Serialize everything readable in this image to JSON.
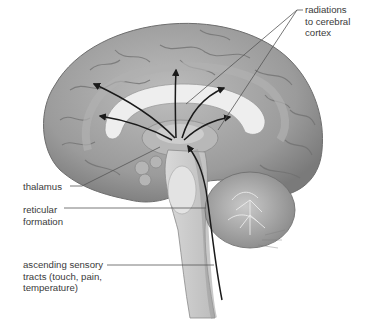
{
  "figure": {
    "background": "#ffffff",
    "colors": {
      "brain_base": "#9a9a9a",
      "brain_light": "#c4c4c4",
      "brain_dark": "#6e6e6e",
      "white_matter": "#eeeeee",
      "arrow": "#1a1a1a",
      "leader_line": "#555555",
      "label_text": "#3a3a3a"
    }
  },
  "labels": {
    "radiations": "radiations\nto cerebral\ncortex",
    "thalamus": "thalamus",
    "reticular": "reticular\nformation",
    "ascending": "ascending sensory\ntracts (touch, pain,\ntemperature)"
  },
  "structures": {
    "cerebrum": "cerebral cortex",
    "corpus_callosum": "corpus callosum",
    "thalamus": "thalamus",
    "brainstem": "brainstem",
    "cerebellum": "cerebellum",
    "spinal_cord": "spinal cord"
  }
}
